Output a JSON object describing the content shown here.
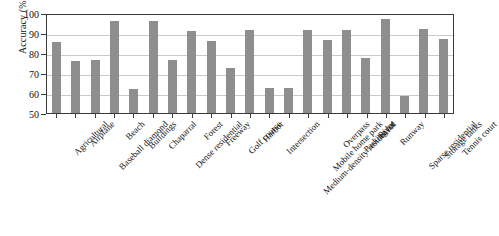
{
  "chart_data": {
    "type": "bar",
    "title": "",
    "xlabel": "",
    "ylabel": "Accuracy (%)",
    "ylim": [
      50,
      100
    ],
    "yticks": [
      50,
      60,
      70,
      80,
      90,
      100
    ],
    "grid": true,
    "legend": "none",
    "bar_color": "#8e8e8e",
    "categories": [
      "Agricultural",
      "Airplane",
      "Baseball diamond",
      "Beach",
      "Buildings",
      "Chaparral",
      "Dense residential",
      "Forest",
      "Freeway",
      "Golf course",
      "Harbor",
      "Intersection",
      "Medium-density residential",
      "Mobile home park",
      "Overpass",
      "Parking lot",
      "River",
      "Runway",
      "Sparse residential",
      "Storage tanks",
      "Tennis court"
    ],
    "values": [
      85.6,
      76.2,
      76.3,
      96.0,
      62.1,
      96.1,
      76.7,
      91.0,
      86.2,
      72.4,
      91.4,
      62.6,
      62.7,
      91.5,
      86.7,
      91.6,
      77.4,
      97.0,
      58.4,
      92.0,
      87.0
    ]
  }
}
